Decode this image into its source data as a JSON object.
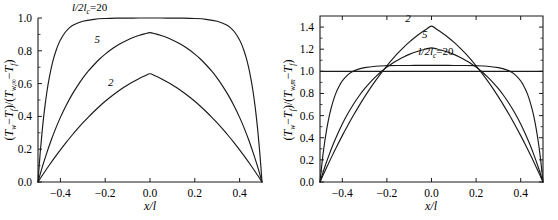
{
  "figure": {
    "panel_count": 2,
    "line_color": "#1a1a1a",
    "background_color": "#ffffff"
  },
  "chart_data": [
    {
      "type": "line",
      "panel": "left",
      "title": "",
      "xlabel": "x/l",
      "ylabel": "(Tw-Tf)/(Tw,∞-Tf)",
      "ylabel_parts": {
        "num_sym1": "T",
        "num_sub1": "w",
        "num_minus": "−",
        "num_sym2": "T",
        "num_sub2": "f",
        "den_sym1": "T",
        "den_sub1": "w,∞",
        "den_sym2": "T",
        "den_sub2": "f"
      },
      "xlim": [
        -0.5,
        0.5
      ],
      "ylim": [
        0.0,
        1.0
      ],
      "xticks": [
        -0.4,
        -0.2,
        0.0,
        0.2,
        0.4
      ],
      "xticklabels": [
        "-0.4",
        "-0.2",
        "0.0",
        "0.2",
        "0.4"
      ],
      "yticks": [
        0.0,
        0.2,
        0.4,
        0.6,
        0.8,
        1.0
      ],
      "yticklabels": [
        "0.0",
        "0.2",
        "0.4",
        "0.6",
        "0.8",
        "1.0"
      ],
      "grid": false,
      "frame": "left-bottom",
      "legend_position": "inline-annotations",
      "annotations": [
        {
          "text": "l/2lc=20",
          "series": "20",
          "x": -0.27,
          "y": 1.04
        },
        {
          "text": "5",
          "series": "5",
          "x": -0.235,
          "y": 0.845
        },
        {
          "text": "2",
          "series": "2",
          "x": -0.175,
          "y": 0.585
        }
      ],
      "series": [
        {
          "name": "l/2lc=20",
          "m": 20,
          "peak": 1.0,
          "x": [
            -0.5,
            -0.49,
            -0.48,
            -0.47,
            -0.46,
            -0.45,
            -0.44,
            -0.43,
            -0.42,
            -0.41,
            -0.4,
            -0.38,
            -0.36,
            -0.34,
            -0.3,
            -0.25,
            -0.2,
            -0.15,
            -0.1,
            -0.05,
            0.0,
            0.05,
            0.1,
            0.15,
            0.2,
            0.25,
            0.3,
            0.34,
            0.36,
            0.38,
            0.4,
            0.41,
            0.42,
            0.43,
            0.44,
            0.45,
            0.46,
            0.47,
            0.48,
            0.49,
            0.5
          ],
          "values": [
            0.0,
            0.181,
            0.33,
            0.452,
            0.552,
            0.633,
            0.7,
            0.755,
            0.799,
            0.836,
            0.866,
            0.91,
            0.94,
            0.959,
            0.98,
            0.992,
            0.997,
            0.999,
            0.999,
            1.0,
            1.0,
            1.0,
            0.999,
            0.999,
            0.997,
            0.992,
            0.98,
            0.959,
            0.94,
            0.91,
            0.866,
            0.836,
            0.799,
            0.755,
            0.7,
            0.633,
            0.552,
            0.452,
            0.33,
            0.181,
            0.0
          ]
        },
        {
          "name": "5",
          "m": 5,
          "peak": 0.9796,
          "x": [
            -0.5,
            -0.48,
            -0.46,
            -0.44,
            -0.42,
            -0.4,
            -0.375,
            -0.35,
            -0.325,
            -0.3,
            -0.275,
            -0.25,
            -0.225,
            -0.2,
            -0.175,
            -0.15,
            -0.125,
            -0.1,
            -0.075,
            -0.05,
            -0.025,
            0.0,
            0.025,
            0.05,
            0.075,
            0.1,
            0.125,
            0.15,
            0.175,
            0.2,
            0.225,
            0.25,
            0.275,
            0.3,
            0.325,
            0.35,
            0.375,
            0.4,
            0.42,
            0.44,
            0.46,
            0.48,
            0.5
          ],
          "values": [
            0.0,
            0.095,
            0.181,
            0.259,
            0.33,
            0.394,
            0.465,
            0.528,
            0.583,
            0.633,
            0.677,
            0.715,
            0.75,
            0.78,
            0.806,
            0.829,
            0.849,
            0.866,
            0.881,
            0.893,
            0.903,
            0.911,
            0.903,
            0.893,
            0.881,
            0.866,
            0.849,
            0.829,
            0.806,
            0.78,
            0.75,
            0.715,
            0.677,
            0.633,
            0.583,
            0.528,
            0.465,
            0.394,
            0.33,
            0.259,
            0.181,
            0.095,
            0.0
          ]
        },
        {
          "name": "2",
          "m": 2,
          "peak": 0.7305,
          "x": [
            -0.5,
            -0.475,
            -0.45,
            -0.425,
            -0.4,
            -0.375,
            -0.35,
            -0.325,
            -0.3,
            -0.275,
            -0.25,
            -0.225,
            -0.2,
            -0.175,
            -0.15,
            -0.125,
            -0.1,
            -0.075,
            -0.05,
            -0.025,
            0.0,
            0.025,
            0.05,
            0.075,
            0.1,
            0.125,
            0.15,
            0.175,
            0.2,
            0.225,
            0.25,
            0.275,
            0.3,
            0.325,
            0.35,
            0.375,
            0.4,
            0.425,
            0.45,
            0.475,
            0.5
          ],
          "values": [
            0.0,
            0.052,
            0.102,
            0.15,
            0.196,
            0.24,
            0.282,
            0.322,
            0.36,
            0.396,
            0.43,
            0.462,
            0.492,
            0.52,
            0.546,
            0.57,
            0.592,
            0.612,
            0.63,
            0.646,
            0.66,
            0.646,
            0.63,
            0.612,
            0.592,
            0.57,
            0.546,
            0.52,
            0.492,
            0.462,
            0.43,
            0.396,
            0.36,
            0.322,
            0.282,
            0.24,
            0.196,
            0.15,
            0.102,
            0.052,
            0.0
          ]
        }
      ]
    },
    {
      "type": "line",
      "panel": "right",
      "title": "",
      "xlabel": "x/l",
      "ylabel": "(Tw-Tf)/(Tw,m-Tf)",
      "ylabel_parts": {
        "num_sym1": "T",
        "num_sub1": "w",
        "num_minus": "−",
        "num_sym2": "T",
        "num_sub2": "f",
        "den_sym1": "T",
        "den_sub1": "w,m",
        "den_sym2": "T",
        "den_sub2": "f"
      },
      "xlim": [
        -0.5,
        0.5
      ],
      "ylim": [
        0.0,
        1.5
      ],
      "xticks": [
        -0.4,
        -0.2,
        0.0,
        0.2,
        0.4
      ],
      "xticklabels": [
        "-0.4",
        "-0.2",
        "0.0",
        "0.2",
        "0.4"
      ],
      "yticks": [
        0.0,
        0.2,
        0.4,
        0.6,
        0.8,
        1.0,
        1.2,
        1.4
      ],
      "yticklabels": [
        "0.0",
        "0.2",
        "0.4",
        "0.6",
        "0.8",
        "1.0",
        "1.2",
        "1.4"
      ],
      "grid": false,
      "frame": "box",
      "reference_line_y": 1.0,
      "legend_position": "inline-annotations",
      "annotations": [
        {
          "text": "2",
          "series": "2",
          "x": -0.105,
          "y": 1.445
        },
        {
          "text": "5",
          "series": "5",
          "x": -0.03,
          "y": 1.3
        },
        {
          "text": "l/2lc=20",
          "series": "20",
          "x": 0.02,
          "y": 1.145
        }
      ],
      "series": [
        {
          "name": "2",
          "m": 2,
          "peak": 1.41,
          "x": [
            -0.5,
            -0.475,
            -0.45,
            -0.425,
            -0.4,
            -0.375,
            -0.35,
            -0.325,
            -0.3,
            -0.275,
            -0.25,
            -0.225,
            -0.2,
            -0.175,
            -0.15,
            -0.125,
            -0.1,
            -0.075,
            -0.05,
            -0.025,
            0.0,
            0.025,
            0.05,
            0.075,
            0.1,
            0.125,
            0.15,
            0.175,
            0.2,
            0.225,
            0.25,
            0.275,
            0.3,
            0.325,
            0.35,
            0.375,
            0.4,
            0.425,
            0.45,
            0.475,
            0.5
          ],
          "values": [
            0.0,
            0.111,
            0.218,
            0.321,
            0.419,
            0.513,
            0.603,
            0.688,
            0.769,
            0.846,
            0.918,
            0.986,
            1.05,
            1.11,
            1.166,
            1.217,
            1.264,
            1.306,
            1.344,
            1.378,
            1.408,
            1.378,
            1.344,
            1.306,
            1.264,
            1.217,
            1.166,
            1.11,
            1.05,
            0.986,
            0.918,
            0.846,
            0.769,
            0.688,
            0.603,
            0.513,
            0.419,
            0.321,
            0.218,
            0.111,
            0.0
          ]
        },
        {
          "name": "5",
          "m": 5,
          "peak": 1.213,
          "x": [
            -0.5,
            -0.48,
            -0.46,
            -0.44,
            -0.42,
            -0.4,
            -0.375,
            -0.35,
            -0.325,
            -0.3,
            -0.275,
            -0.25,
            -0.225,
            -0.2,
            -0.175,
            -0.15,
            -0.125,
            -0.1,
            -0.075,
            -0.05,
            -0.025,
            0.0,
            0.025,
            0.05,
            0.075,
            0.1,
            0.125,
            0.15,
            0.175,
            0.2,
            0.225,
            0.25,
            0.275,
            0.3,
            0.325,
            0.35,
            0.375,
            0.4,
            0.42,
            0.44,
            0.46,
            0.48,
            0.5
          ],
          "values": [
            0.0,
            0.127,
            0.241,
            0.345,
            0.439,
            0.525,
            0.619,
            0.703,
            0.777,
            0.843,
            0.901,
            0.952,
            0.998,
            1.038,
            1.073,
            1.103,
            1.13,
            1.153,
            1.172,
            1.188,
            1.202,
            1.212,
            1.202,
            1.188,
            1.172,
            1.153,
            1.13,
            1.103,
            1.073,
            1.038,
            0.998,
            0.952,
            0.901,
            0.843,
            0.777,
            0.703,
            0.619,
            0.525,
            0.439,
            0.345,
            0.241,
            0.127,
            0.0
          ]
        },
        {
          "name": "l/2lc=20",
          "m": 20,
          "peak": 1.054,
          "x": [
            -0.5,
            -0.49,
            -0.48,
            -0.47,
            -0.46,
            -0.45,
            -0.44,
            -0.43,
            -0.42,
            -0.41,
            -0.4,
            -0.38,
            -0.36,
            -0.34,
            -0.3,
            -0.25,
            -0.2,
            -0.15,
            -0.1,
            -0.05,
            0.0,
            0.05,
            0.1,
            0.15,
            0.2,
            0.25,
            0.3,
            0.34,
            0.36,
            0.38,
            0.4,
            0.41,
            0.42,
            0.43,
            0.44,
            0.45,
            0.46,
            0.47,
            0.48,
            0.49,
            0.5
          ],
          "values": [
            0.0,
            0.191,
            0.348,
            0.476,
            0.582,
            0.667,
            0.738,
            0.796,
            0.842,
            0.881,
            0.913,
            0.959,
            0.991,
            1.011,
            1.033,
            1.046,
            1.051,
            1.053,
            1.053,
            1.054,
            1.054,
            1.054,
            1.053,
            1.053,
            1.051,
            1.046,
            1.033,
            1.011,
            0.991,
            0.959,
            0.913,
            0.881,
            0.842,
            0.796,
            0.738,
            0.667,
            0.582,
            0.476,
            0.348,
            0.191,
            0.0
          ]
        }
      ]
    }
  ]
}
